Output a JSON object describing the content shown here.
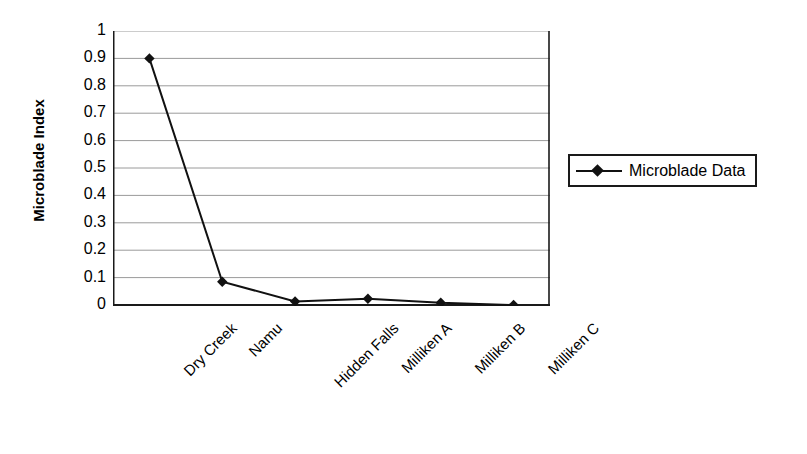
{
  "chart_data": {
    "type": "line",
    "title": "",
    "xlabel": "",
    "ylabel": "Microblade Index",
    "categories": [
      "Dry Creek",
      "Namu",
      "Hidden Falls",
      "Milliken A",
      "Milliken B",
      "Milliken C"
    ],
    "series": [
      {
        "name": "Microblade Data",
        "values": [
          0.9,
          0.085,
          0.013,
          0.023,
          0.008,
          0.0
        ],
        "marker": "diamond",
        "color": "#111111"
      }
    ],
    "ylim": [
      0,
      1
    ],
    "y_ticks": [
      "1",
      "0.9",
      "0.8",
      "0.7",
      "0.6",
      "0.5",
      "0.4",
      "0.3",
      "0.2",
      "0.1",
      "0"
    ],
    "y_tick_values": [
      1,
      0.9,
      0.8,
      0.7,
      0.6,
      0.5,
      0.4,
      0.3,
      0.2,
      0.1,
      0
    ],
    "grid": "horizontal",
    "grid_color": "#9a9a9a",
    "axis_color": "#1a1a1a",
    "plot_background": "#ffffff",
    "legend": {
      "position": "right",
      "entries": [
        "Microblade Data"
      ]
    },
    "x_tick_label_rotation": -45
  },
  "legend": {
    "label": "Microblade Data"
  },
  "axes": {
    "y_title": "Microblade Index"
  }
}
